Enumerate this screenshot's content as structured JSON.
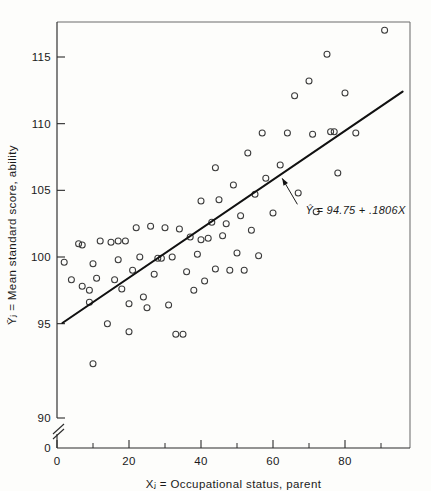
{
  "chart_data": {
    "type": "scatter",
    "title": "",
    "xlabel": "Xⱼ = Occupational status, parent",
    "ylabel": "Ȳⱼ = Mean standard score, ability",
    "xlim": [
      0,
      96
    ],
    "ylim": [
      89,
      118
    ],
    "grid": false,
    "legend": null,
    "axis_break": {
      "axis": "y",
      "between": [
        0,
        90
      ],
      "symbol": "double-slash"
    },
    "xticks": [
      0,
      20,
      40,
      60,
      80
    ],
    "xticklabels": [
      "0",
      "20",
      "40",
      "60",
      "80"
    ],
    "xminorticks": [
      10,
      30,
      50,
      70,
      90
    ],
    "yticks": [
      90,
      95,
      100,
      105,
      110,
      115
    ],
    "yticklabels": [
      "90",
      "95",
      "100",
      "105",
      "110",
      "115"
    ],
    "y_origin_label": "0",
    "x_origin_label": "0",
    "marker": "open-circle",
    "annotation": {
      "text": "Ŷ = 94.75 + .1806X",
      "equation_intercept": 94.75,
      "equation_slope": 0.1806,
      "x": 69,
      "y": 103.2,
      "arrow_to_x": 62,
      "arrow_to_y": 106.2
    },
    "regression_line": {
      "label": "fitted line",
      "x_start": 1.5,
      "y_start": 95.05,
      "x_end": 96,
      "y_end": 112.4
    },
    "points": [
      {
        "x": 2,
        "y": 99.6
      },
      {
        "x": 4,
        "y": 98.3
      },
      {
        "x": 6,
        "y": 101.0
      },
      {
        "x": 7,
        "y": 100.9
      },
      {
        "x": 7,
        "y": 97.8
      },
      {
        "x": 9,
        "y": 97.5
      },
      {
        "x": 9,
        "y": 96.6
      },
      {
        "x": 10,
        "y": 92.0
      },
      {
        "x": 10,
        "y": 99.5
      },
      {
        "x": 11,
        "y": 98.4
      },
      {
        "x": 12,
        "y": 101.2
      },
      {
        "x": 14,
        "y": 95.0
      },
      {
        "x": 15,
        "y": 101.1
      },
      {
        "x": 16,
        "y": 98.3
      },
      {
        "x": 17,
        "y": 99.8
      },
      {
        "x": 17,
        "y": 101.2
      },
      {
        "x": 18,
        "y": 97.6
      },
      {
        "x": 19,
        "y": 101.2
      },
      {
        "x": 20,
        "y": 94.4
      },
      {
        "x": 20,
        "y": 96.5
      },
      {
        "x": 21,
        "y": 99.0
      },
      {
        "x": 22,
        "y": 102.2
      },
      {
        "x": 23,
        "y": 100.0
      },
      {
        "x": 24,
        "y": 97.0
      },
      {
        "x": 25,
        "y": 96.2
      },
      {
        "x": 26,
        "y": 102.3
      },
      {
        "x": 27,
        "y": 98.7
      },
      {
        "x": 28,
        "y": 99.9
      },
      {
        "x": 29,
        "y": 99.9
      },
      {
        "x": 30,
        "y": 102.2
      },
      {
        "x": 31,
        "y": 96.4
      },
      {
        "x": 32,
        "y": 100.0
      },
      {
        "x": 33,
        "y": 94.2
      },
      {
        "x": 34,
        "y": 102.1
      },
      {
        "x": 35,
        "y": 94.2
      },
      {
        "x": 36,
        "y": 98.9
      },
      {
        "x": 37,
        "y": 101.5
      },
      {
        "x": 38,
        "y": 97.5
      },
      {
        "x": 39,
        "y": 100.2
      },
      {
        "x": 40,
        "y": 104.2
      },
      {
        "x": 40,
        "y": 101.3
      },
      {
        "x": 41,
        "y": 98.2
      },
      {
        "x": 42,
        "y": 101.4
      },
      {
        "x": 43,
        "y": 102.6
      },
      {
        "x": 44,
        "y": 106.7
      },
      {
        "x": 44,
        "y": 99.1
      },
      {
        "x": 45,
        "y": 104.3
      },
      {
        "x": 46,
        "y": 101.6
      },
      {
        "x": 47,
        "y": 102.5
      },
      {
        "x": 48,
        "y": 99.0
      },
      {
        "x": 49,
        "y": 105.4
      },
      {
        "x": 50,
        "y": 100.3
      },
      {
        "x": 51,
        "y": 103.1
      },
      {
        "x": 52,
        "y": 99.0
      },
      {
        "x": 53,
        "y": 107.8
      },
      {
        "x": 54,
        "y": 102.0
      },
      {
        "x": 55,
        "y": 104.7
      },
      {
        "x": 56,
        "y": 100.1
      },
      {
        "x": 57,
        "y": 109.3
      },
      {
        "x": 58,
        "y": 105.9
      },
      {
        "x": 60,
        "y": 103.3
      },
      {
        "x": 62,
        "y": 106.9
      },
      {
        "x": 64,
        "y": 109.3
      },
      {
        "x": 66,
        "y": 112.1
      },
      {
        "x": 67,
        "y": 104.8
      },
      {
        "x": 70,
        "y": 113.2
      },
      {
        "x": 71,
        "y": 109.2
      },
      {
        "x": 72,
        "y": 103.4
      },
      {
        "x": 75,
        "y": 115.2
      },
      {
        "x": 76,
        "y": 109.4
      },
      {
        "x": 77,
        "y": 109.4
      },
      {
        "x": 78,
        "y": 106.3
      },
      {
        "x": 80,
        "y": 112.3
      },
      {
        "x": 83,
        "y": 109.3
      },
      {
        "x": 91,
        "y": 117.0
      }
    ]
  }
}
